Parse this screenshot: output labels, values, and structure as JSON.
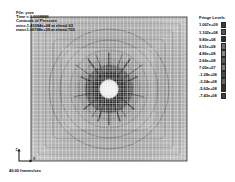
{
  "app": {
    "name": "LS-PrePost",
    "background": "#ffffff",
    "canvas": {
      "width": 235,
      "height": 182
    }
  },
  "header": {
    "lines": [
      "File: yxzz",
      "Time =  0.0008886",
      "Contours of Pressure",
      "min=-1.43394e+08 at elem# 63",
      "max=1.06704e+09 at elem# 705"
    ],
    "file_label": "File: yxzz",
    "time_label": "Time =  0.0008886",
    "contour_label": "Contours of Pressure",
    "min_label": "min=-1.43394e+08 at elem# 63",
    "max_label": "max=1.06704e+09 at elem# 705"
  },
  "legend": {
    "title": "Fringe Levels",
    "levels": [
      {
        "label": "1.067e+09",
        "color": "#3a3a3a"
      },
      {
        "label": "1.102e+08",
        "color": "#555555"
      },
      {
        "label": "9.80e+08",
        "color": "#2e2e2e"
      },
      {
        "label": "8.51e+08",
        "color": "#6e6e6e"
      },
      {
        "label": "4.86e+08",
        "color": "#888888"
      },
      {
        "label": "2.66e+08",
        "color": "#5c5c5c"
      },
      {
        "label": "7.00e+07",
        "color": "#7a7a7a"
      },
      {
        "label": "-1.28e+08",
        "color": "#4a4a4a"
      },
      {
        "label": "-3.24e+08",
        "color": "#666666"
      },
      {
        "label": "-5.62e+08",
        "color": "#303030"
      },
      {
        "label": "-7.43e+08",
        "color": "#3f3f3f"
      }
    ]
  },
  "axis_triad": {
    "name": "axis-triad",
    "vertical_axis_label": "Z",
    "horizontal_axis_label": "X"
  },
  "footer": {
    "frame_rate_label": "40.00 frames/sec"
  },
  "chart_data": {
    "type": "heatmap",
    "title": "Contours of Pressure",
    "colormap": "grayscale",
    "grid": true,
    "legend_position": "right",
    "value_range": [
      -743000000,
      1067000000
    ],
    "units": "Pa",
    "mesh": {
      "shape": "square",
      "nx": 46,
      "ny": 42,
      "inclusion": {
        "shape": "circle",
        "cx": 0.5,
        "cy": 0.5,
        "r": 0.075,
        "value": 1067000000
      }
    },
    "contour_levels": [
      1067000000,
      110200000,
      980000000,
      851000000,
      486000000,
      266000000,
      70000000,
      -128000000,
      -324000000,
      -562000000,
      -743000000
    ],
    "radial_bands": [
      0.1,
      0.16,
      0.23,
      0.31,
      0.4,
      0.49
    ],
    "crack_spokes": 8,
    "annotations": [
      "min=-1.43394e+08 at elem# 63",
      "max=1.06704e+09 at elem# 705"
    ],
    "xlabel": "X",
    "ylabel": "Z"
  }
}
